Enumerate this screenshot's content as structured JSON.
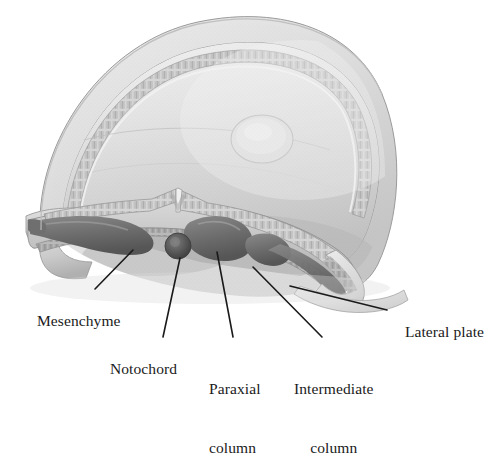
{
  "figure": {
    "background_color": "#ffffff",
    "ink_color": "#1a1a1a"
  },
  "labels": [
    {
      "id": "mesenchyme",
      "text": "Mesenchyme",
      "lines": [
        "Mesenchyme"
      ],
      "align": "left"
    },
    {
      "id": "notochord",
      "text": "Notochord",
      "lines": [
        "Notochord"
      ],
      "align": "left"
    },
    {
      "id": "paraxial-column",
      "text": "Paraxial column",
      "lines": [
        "Paraxial",
        "column"
      ],
      "align": "left"
    },
    {
      "id": "intermediate-column",
      "text": "Intermediate column",
      "lines": [
        "Intermediate",
        "column"
      ],
      "align": "center"
    },
    {
      "id": "lateral-plate",
      "text": "Lateral plate",
      "lines": [
        "Lateral plate"
      ],
      "align": "left"
    }
  ],
  "label_text": {
    "mesenchyme": "Mesenchyme",
    "notochord": "Notochord",
    "paraxial_line1": "Paraxial",
    "paraxial_line2": "column",
    "intermediate_line1": "Intermediate",
    "intermediate_line2": "column",
    "lateral_plate": "Lateral plate"
  },
  "leader_lines": [
    {
      "id": "mesenchyme",
      "from": [
        133,
        250
      ],
      "to": [
        95,
        289
      ]
    },
    {
      "id": "notochord",
      "from": [
        180,
        258
      ],
      "to": [
        163,
        337
      ]
    },
    {
      "id": "paraxial-column",
      "from": [
        217,
        252
      ],
      "to": [
        233,
        337
      ]
    },
    {
      "id": "intermediate-column",
      "from": [
        253,
        267
      ],
      "to": [
        322,
        337
      ]
    },
    {
      "id": "lateral-plate",
      "from": [
        290,
        286
      ],
      "to": [
        387,
        310
      ]
    }
  ],
  "anatomy_parts": [
    "amnion-dome",
    "amniotic-cavity",
    "neural-groove",
    "notochord",
    "paraxial-column",
    "intermediate-column",
    "lateral-plate",
    "mesenchyme",
    "ectoderm-epithelium",
    "endoderm-layer",
    "yolk-sac-roof"
  ],
  "palette": {
    "paper": "#ffffff",
    "tissue_light": "#e8e8e8",
    "tissue_mid": "#c9c9c9",
    "tissue_dark": "#8f8f8f",
    "mass_dark": "#6e6e6e",
    "mass_darkest": "#4f4f4f",
    "outline": "#7a7a7a",
    "ink": "#1a1a1a"
  }
}
